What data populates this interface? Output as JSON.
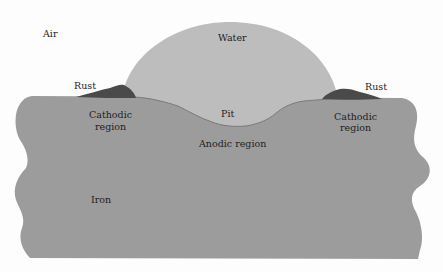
{
  "figure": {
    "colors": {
      "background": "#fdfdfd",
      "iron": "#9c9c9c",
      "water": "#bdbdbd",
      "rust": "#4a4a4a",
      "pit_line": "#7a7a7a",
      "text": "#1e1e1e"
    }
  },
  "labels": {
    "air": "Air",
    "water": "Water",
    "rust_left": "Rust",
    "rust_right": "Rust",
    "cathodic_left_line1": "Cathodic",
    "cathodic_left_line2": "region",
    "cathodic_right_line1": "Cathodic",
    "cathodic_right_line2": "region",
    "pit": "Pit",
    "anodic": "Anodic region",
    "iron": "Iron"
  }
}
